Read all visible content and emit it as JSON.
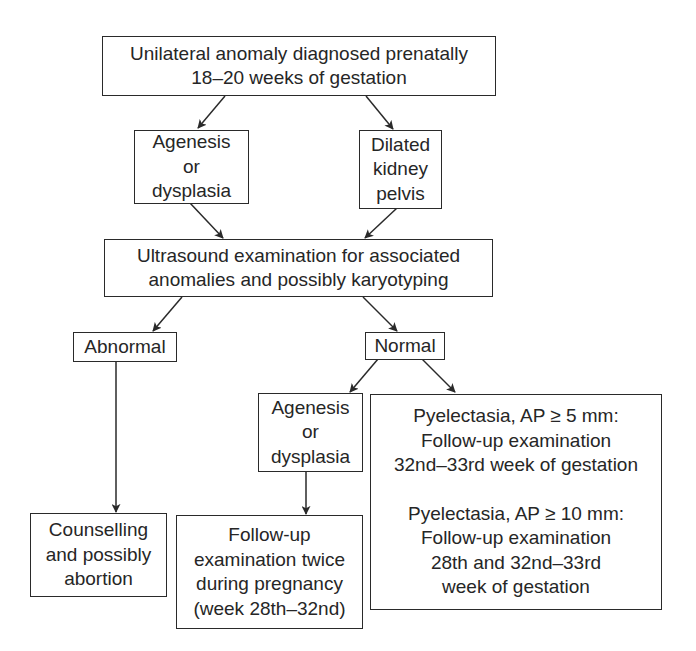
{
  "diagram": {
    "type": "flowchart",
    "colors": {
      "stroke": "#2a2a2a",
      "text": "#262626",
      "background": "#ffffff"
    },
    "nodes": {
      "root": {
        "lines": [
          "Unilateral anomaly diagnosed prenatally",
          "18–20 weeks of gestation"
        ]
      },
      "agenesis_top": {
        "lines": [
          "Agenesis",
          "or",
          "dysplasia"
        ]
      },
      "dilated": {
        "lines": [
          "Dilated",
          "kidney",
          "pelvis"
        ]
      },
      "ultrasound": {
        "lines": [
          "Ultrasound examination for associated",
          "anomalies and possibly karyotyping"
        ]
      },
      "abnormal": {
        "lines": [
          "Abnormal"
        ]
      },
      "normal": {
        "lines": [
          "Normal"
        ]
      },
      "agenesis_bottom": {
        "lines": [
          "Agenesis",
          "or",
          "dysplasia"
        ]
      },
      "pyelectasia": {
        "block1": [
          "Pyelectasia, AP ≥ 5 mm:",
          "Follow-up examination",
          "32nd–33rd week of gestation"
        ],
        "block2": [
          "Pyelectasia, AP ≥ 10 mm:",
          "Follow-up examination",
          "28th and 32nd–33rd",
          "week of gestation"
        ]
      },
      "counselling": {
        "lines": [
          "Counselling",
          "and possibly",
          "abortion"
        ]
      },
      "followup": {
        "lines": [
          "Follow-up",
          "examination twice",
          "during pregnancy",
          "(week 28th–32nd)"
        ]
      }
    },
    "edges": [
      {
        "from": "root",
        "to": "agenesis_top"
      },
      {
        "from": "root",
        "to": "dilated"
      },
      {
        "from": "agenesis_top",
        "to": "ultrasound"
      },
      {
        "from": "dilated",
        "to": "ultrasound"
      },
      {
        "from": "ultrasound",
        "to": "abnormal"
      },
      {
        "from": "ultrasound",
        "to": "normal"
      },
      {
        "from": "normal",
        "to": "agenesis_bottom"
      },
      {
        "from": "normal",
        "to": "pyelectasia"
      },
      {
        "from": "abnormal",
        "to": "counselling"
      },
      {
        "from": "agenesis_bottom",
        "to": "followup"
      }
    ]
  }
}
